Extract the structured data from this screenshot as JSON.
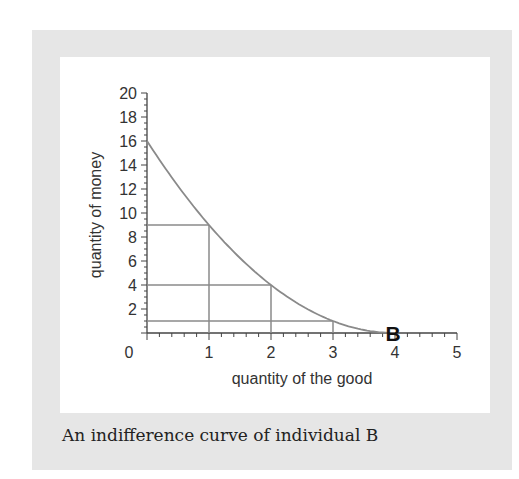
{
  "chart_data": {
    "type": "line",
    "title": "",
    "caption": "An indifference curve of individual B",
    "xlabel": "quantity of the good",
    "ylabel": "quantity of money",
    "xlim": [
      0,
      5
    ],
    "ylim": [
      0,
      20
    ],
    "x_ticks": [
      "0",
      "1",
      "2",
      "3",
      "4",
      "5"
    ],
    "y_ticks": [
      "2",
      "4",
      "6",
      "8",
      "10",
      "12",
      "14",
      "16",
      "18",
      "20"
    ],
    "grid": false,
    "series": [
      {
        "name": "Indifference curve of B",
        "x": [
          0,
          1,
          2,
          3,
          4,
          5
        ],
        "y": [
          16,
          9,
          4,
          1,
          0,
          0
        ]
      }
    ],
    "guide_lines": [
      {
        "x": 1,
        "y": 9
      },
      {
        "x": 2,
        "y": 4
      },
      {
        "x": 3,
        "y": 1
      }
    ],
    "annotations": [
      {
        "text": "B",
        "x": 4,
        "y": 0
      }
    ],
    "colors": {
      "curve": "#8a8a8a",
      "axis": "#444444",
      "frame": "#e6e6e6"
    }
  }
}
